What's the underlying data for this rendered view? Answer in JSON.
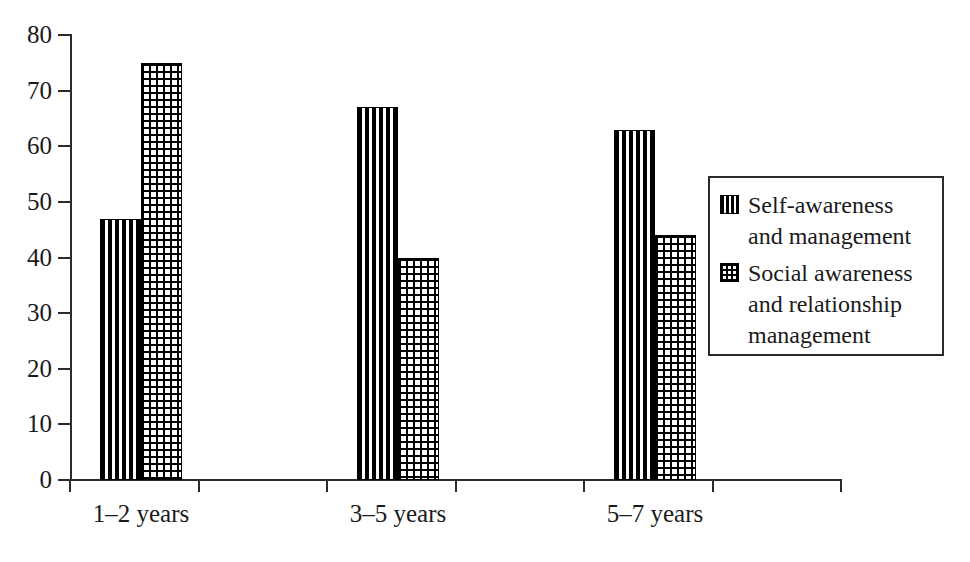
{
  "chart_data": {
    "type": "bar",
    "title": "",
    "subtitle": "",
    "xlabel": "",
    "ylabel": "",
    "categories": [
      "1–2 years",
      "3–5 years",
      "5–7 years"
    ],
    "series": [
      {
        "name": "Self-awareness and management",
        "pattern": "vertical-stripes",
        "values": [
          47,
          67,
          63
        ]
      },
      {
        "name": "Social awareness and relationship management",
        "pattern": "crosshatch-grid",
        "values": [
          75,
          40,
          44
        ]
      }
    ],
    "ylim": [
      0,
      80
    ],
    "ytick_values": [
      0,
      10,
      20,
      30,
      40,
      50,
      60,
      70,
      80
    ],
    "ytick_labels": [
      "0",
      "10",
      "20",
      "30",
      "40",
      "50",
      "60",
      "70",
      "80"
    ],
    "grid": false,
    "legend_position": "right",
    "colors": {
      "ink": "#000000",
      "axis": "#2b2b2b",
      "background": "#ffffff"
    }
  },
  "legend": {
    "entries": [
      {
        "swatch": "vertical-stripes-swatch",
        "label": "Self-awareness and management"
      },
      {
        "swatch": "crosshatch-grid-swatch",
        "label": "Social awareness and relationship management"
      }
    ]
  }
}
